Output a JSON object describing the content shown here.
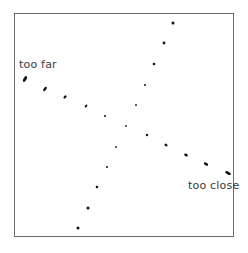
{
  "labels": {
    "far": "too far",
    "close": "too close"
  },
  "colors": {
    "frame": "#6a6a6a",
    "dots": "#111111",
    "text": "#3a3a3a",
    "background": "#ffffff"
  },
  "series": [
    {
      "name": "descending",
      "points": [
        {
          "x": 25,
          "y": 79,
          "rx": 1.5,
          "ry": 3.2,
          "rot": 30
        },
        {
          "x": 45,
          "y": 89,
          "rx": 1.3,
          "ry": 2.5,
          "rot": 40
        },
        {
          "x": 65,
          "y": 97,
          "rx": 1.2,
          "ry": 1.9,
          "rot": 45
        },
        {
          "x": 86,
          "y": 106,
          "rx": 1.0,
          "ry": 1.6,
          "rot": 45
        },
        {
          "x": 105,
          "y": 116,
          "rx": 1.0,
          "ry": 1.0,
          "rot": 0
        },
        {
          "x": 126,
          "y": 126,
          "rx": 0.9,
          "ry": 0.9,
          "rot": 0
        },
        {
          "x": 147,
          "y": 135,
          "rx": 1.2,
          "ry": 1.2,
          "rot": 0
        },
        {
          "x": 166,
          "y": 145,
          "rx": 1.7,
          "ry": 1.2,
          "rot": 30
        },
        {
          "x": 186,
          "y": 155,
          "rx": 2.0,
          "ry": 1.3,
          "rot": 30
        },
        {
          "x": 206,
          "y": 164,
          "rx": 2.4,
          "ry": 1.3,
          "rot": 30
        },
        {
          "x": 228,
          "y": 173,
          "rx": 3.2,
          "ry": 1.4,
          "rot": 30
        }
      ]
    },
    {
      "name": "ascending",
      "points": [
        {
          "x": 78,
          "y": 228,
          "rx": 1.5,
          "ry": 1.5,
          "rot": 0
        },
        {
          "x": 88,
          "y": 208,
          "rx": 1.5,
          "ry": 1.5,
          "rot": 0
        },
        {
          "x": 97,
          "y": 187,
          "rx": 1.3,
          "ry": 1.3,
          "rot": 0
        },
        {
          "x": 107,
          "y": 167,
          "rx": 1.0,
          "ry": 1.0,
          "rot": 0
        },
        {
          "x": 116,
          "y": 147,
          "rx": 0.9,
          "ry": 0.9,
          "rot": 0
        },
        {
          "x": 136,
          "y": 105,
          "rx": 0.9,
          "ry": 0.9,
          "rot": 0
        },
        {
          "x": 145,
          "y": 85,
          "rx": 1.0,
          "ry": 1.0,
          "rot": 0
        },
        {
          "x": 154,
          "y": 64,
          "rx": 1.3,
          "ry": 1.3,
          "rot": 0
        },
        {
          "x": 164,
          "y": 43,
          "rx": 1.4,
          "ry": 1.4,
          "rot": 0
        },
        {
          "x": 173,
          "y": 23,
          "rx": 1.5,
          "ry": 1.5,
          "rot": 0
        }
      ]
    }
  ]
}
